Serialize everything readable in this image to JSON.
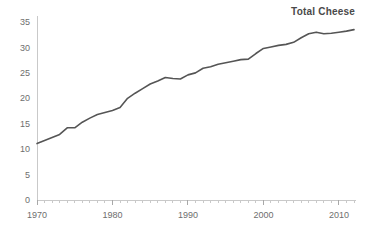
{
  "chart_data": {
    "type": "line",
    "title": "Total Cheese",
    "xlabel": "",
    "ylabel": "",
    "xlim": [
      1970,
      2012
    ],
    "ylim": [
      0,
      35
    ],
    "grid": false,
    "legend_position": "none",
    "y_ticks": [
      0,
      5,
      10,
      15,
      20,
      25,
      30,
      35
    ],
    "x_ticks": [
      1970,
      1980,
      1990,
      2000,
      2010
    ],
    "x_tick_labels": [
      "1970",
      "1980",
      "1990",
      "2000",
      "2010"
    ],
    "y_tick_labels": [
      "0",
      "5",
      "10",
      "15",
      "20",
      "25",
      "30",
      "35"
    ],
    "minor_x_tick_interval": 1,
    "line_color": "#555555",
    "axis_color": "#c9c9c9",
    "tick_label_color": "#6e6e6e",
    "title_color": "#4a4a4a",
    "series": [
      {
        "name": "Total Cheese",
        "x": [
          1970,
          1971,
          1972,
          1973,
          1974,
          1975,
          1976,
          1977,
          1978,
          1979,
          1980,
          1981,
          1982,
          1983,
          1984,
          1985,
          1986,
          1987,
          1988,
          1989,
          1990,
          1991,
          1992,
          1993,
          1994,
          1995,
          1996,
          1997,
          1998,
          1999,
          2000,
          2001,
          2002,
          2003,
          2004,
          2005,
          2006,
          2007,
          2008,
          2009,
          2010,
          2011,
          2012
        ],
        "values": [
          11.1,
          11.7,
          12.3,
          12.9,
          14.2,
          14.2,
          15.3,
          16.1,
          16.8,
          17.2,
          17.6,
          18.2,
          20.0,
          21.0,
          21.9,
          22.8,
          23.4,
          24.1,
          23.9,
          23.8,
          24.6,
          25.0,
          25.9,
          26.2,
          26.7,
          27.0,
          27.3,
          27.6,
          27.7,
          28.8,
          29.8,
          30.1,
          30.4,
          30.6,
          31.0,
          31.9,
          32.7,
          33.0,
          32.7,
          32.8,
          33.0,
          33.2,
          33.5
        ]
      }
    ]
  }
}
